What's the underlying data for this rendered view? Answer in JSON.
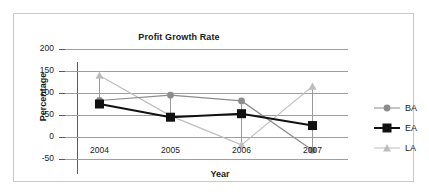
{
  "chart_data": {
    "type": "line",
    "title": "Profit Growth Rate",
    "xlabel": "Year",
    "ylabel": "Percentage",
    "categories": [
      "2004",
      "2005",
      "2006",
      "2007"
    ],
    "x": [
      2004,
      2005,
      2006,
      2007
    ],
    "ylim": [
      -50,
      200
    ],
    "yticks": [
      200,
      150,
      100,
      50,
      0,
      -50
    ],
    "ytick_labels": [
      "200",
      "150",
      "100",
      "50",
      "0",
      "-50"
    ],
    "grid": true,
    "legend_position": "right",
    "series": [
      {
        "name": "BA",
        "marker": "circle",
        "color": "#8c8c8c",
        "values": [
          83,
          95,
          82,
          -30
        ]
      },
      {
        "name": "EA",
        "marker": "square",
        "color": "#111111",
        "values": [
          75,
          45,
          53,
          26
        ]
      },
      {
        "name": "LA",
        "marker": "triangle",
        "color": "#bdbdbd",
        "values": [
          140,
          48,
          -18,
          115
        ]
      }
    ]
  },
  "legend": {
    "items": [
      {
        "label": "BA"
      },
      {
        "label": "EA"
      },
      {
        "label": "LA"
      }
    ]
  },
  "axis": {
    "y_title": "Percentage",
    "x_title": "Year",
    "y_labels": [
      "200",
      "150",
      "100",
      "50",
      "0",
      "-50"
    ],
    "x_labels": [
      "2004",
      "2005",
      "2006",
      "2007"
    ]
  },
  "colors": {
    "series_ba": "#8c8c8c",
    "series_ea": "#111111",
    "series_la": "#bdbdbd",
    "grid": "#9e9e9e",
    "axis": "#5a5a5a",
    "frame": "#c9c9c9",
    "text": "#1a1a1a"
  }
}
